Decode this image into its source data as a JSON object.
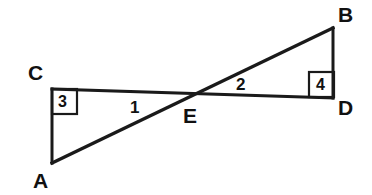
{
  "figure": {
    "width": 372,
    "height": 195,
    "background_color": "#ffffff",
    "stroke_color": "#1a1a1a",
    "text_color": "#111111",
    "stroke_width": 3
  },
  "points": {
    "A": {
      "label": "A",
      "x": 52,
      "y": 163,
      "label_x": 33,
      "label_y": 170
    },
    "B": {
      "label": "B",
      "x": 333,
      "y": 28,
      "label_x": 338,
      "label_y": 4
    },
    "C": {
      "label": "C",
      "x": 52,
      "y": 89,
      "label_x": 28,
      "label_y": 62
    },
    "D": {
      "label": "D",
      "x": 333,
      "y": 98,
      "label_x": 338,
      "label_y": 97
    },
    "E": {
      "label": "E",
      "x": 190,
      "y": 98,
      "label_x": 183,
      "label_y": 105
    }
  },
  "segments": [
    {
      "name": "segment-CD",
      "from": "C",
      "to": "D",
      "x1": 52,
      "y1": 89,
      "x2": 333,
      "y2": 98
    },
    {
      "name": "segment-AB",
      "from": "A",
      "to": "B",
      "x1": 52,
      "y1": 163,
      "x2": 333,
      "y2": 28
    },
    {
      "name": "segment-CA",
      "from": "C",
      "to": "A",
      "x1": 52,
      "y1": 89,
      "x2": 52,
      "y2": 163
    },
    {
      "name": "segment-BD",
      "from": "B",
      "to": "D",
      "x1": 333,
      "y1": 28,
      "x2": 333,
      "y2": 98
    }
  ],
  "angle_labels": [
    {
      "name": "angle-1",
      "text": "1",
      "x": 130,
      "y": 99
    },
    {
      "name": "angle-2",
      "text": "2",
      "x": 236,
      "y": 76
    }
  ],
  "right_angle_marks": [
    {
      "name": "right-angle-3",
      "text": "3",
      "at_vertex": "C",
      "box_x": 52,
      "box_y": 89,
      "box_size": 25,
      "text_x": 58,
      "text_y": 94
    },
    {
      "name": "right-angle-4",
      "text": "4",
      "at_vertex": "D",
      "box_x": 309,
      "box_y": 72,
      "box_size": 25,
      "text_x": 316,
      "text_y": 77
    }
  ]
}
